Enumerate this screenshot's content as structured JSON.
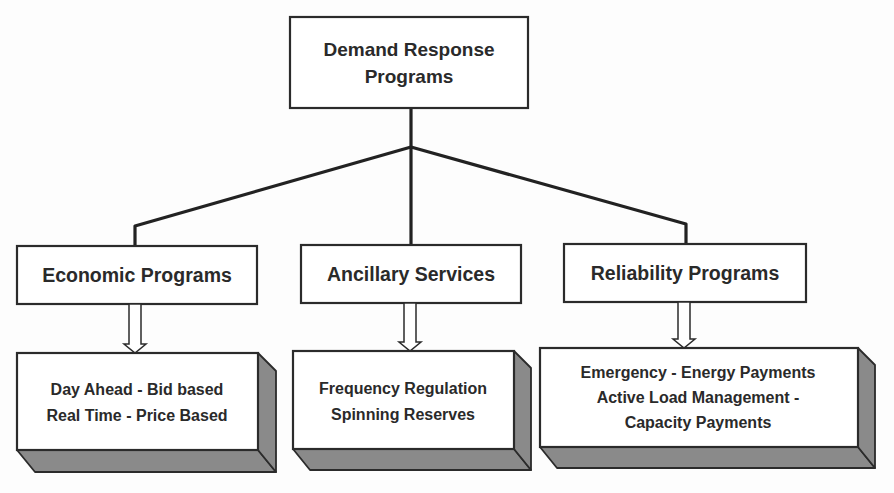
{
  "diagram": {
    "type": "hierarchy",
    "root": {
      "id": "demand-response-programs",
      "lines": [
        "Demand Response",
        "Programs"
      ]
    },
    "categories": [
      {
        "id": "economic-programs",
        "label": "Economic Programs",
        "details": [
          "Day Ahead - Bid based",
          "Real Time - Price Based"
        ]
      },
      {
        "id": "ancillary-services",
        "label": "Ancillary Services",
        "details": [
          "Frequency Regulation",
          "Spinning Reserves"
        ]
      },
      {
        "id": "reliability-programs",
        "label": "Reliability Programs",
        "details": [
          "Emergency - Energy Payments",
          "Active Load Management -",
          "Capacity Payments"
        ]
      }
    ],
    "colors": {
      "line": "#222222",
      "box_fill": "#ffffff",
      "box_depth": "#8a8a8a",
      "text": "#2a2a2a"
    }
  }
}
